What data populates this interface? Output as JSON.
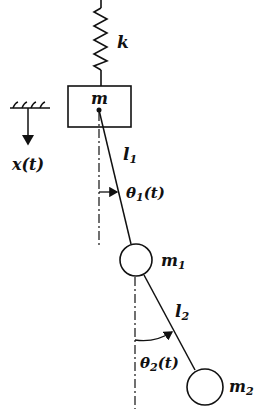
{
  "diagram": {
    "labels": {
      "spring": "k",
      "mass": "m",
      "displacement": "x(t)",
      "length1": "l",
      "length1_sub": "1",
      "angle1": "θ",
      "angle1_sub": "1",
      "angle1_arg": "(t)",
      "mass1": "m",
      "mass1_sub": "1",
      "length2": "l",
      "length2_sub": "2",
      "angle2": "θ",
      "angle2_sub": "2",
      "angle2_arg": "(t)",
      "mass2": "m",
      "mass2_sub": "2"
    },
    "colors": {
      "stroke": "#111111",
      "background": "#ffffff"
    }
  }
}
